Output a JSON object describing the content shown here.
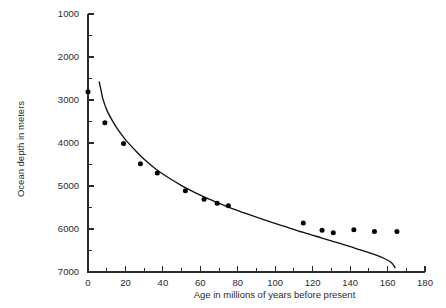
{
  "chart_data": {
    "type": "scatter",
    "title": "",
    "subtitle": "",
    "xlabel": "Age in millions of years before present",
    "ylabel": "Ocean depth in meters",
    "xlim": [
      0,
      180
    ],
    "ylim": [
      1000,
      7000
    ],
    "y_axis_inverted": true,
    "grid": false,
    "legend": null,
    "legend_position": "none",
    "x_ticks": [
      0,
      20,
      40,
      60,
      80,
      100,
      120,
      140,
      160,
      180
    ],
    "x_tick_labels": [
      "0",
      "20",
      "40",
      "60",
      "80",
      "100",
      "120",
      "140",
      "160",
      "180"
    ],
    "x_minor_ticks": [
      10,
      30,
      50,
      70,
      90,
      110,
      130,
      150,
      170
    ],
    "y_ticks": [
      1000,
      2000,
      3000,
      4000,
      5000,
      6000,
      7000
    ],
    "y_tick_labels": [
      "1000",
      "2000",
      "3000",
      "4000",
      "5000",
      "6000",
      "7000"
    ],
    "y_minor_ticks": [
      1500,
      2500,
      3500,
      4500,
      5500,
      6500
    ],
    "series": [
      {
        "name": "Observed depth",
        "type": "scatter",
        "marker": "filled-circle",
        "marker_color": "#000000",
        "points": [
          {
            "x": 0,
            "y": 2810
          },
          {
            "x": 9,
            "y": 3530
          },
          {
            "x": 19,
            "y": 4010
          },
          {
            "x": 28,
            "y": 4480
          },
          {
            "x": 37,
            "y": 4700
          },
          {
            "x": 52,
            "y": 5110
          },
          {
            "x": 62,
            "y": 5310
          },
          {
            "x": 69,
            "y": 5400
          },
          {
            "x": 75,
            "y": 5460
          },
          {
            "x": 115,
            "y": 5860
          },
          {
            "x": 125,
            "y": 6030
          },
          {
            "x": 131,
            "y": 6090
          },
          {
            "x": 142,
            "y": 6020
          },
          {
            "x": 153,
            "y": 6060
          },
          {
            "x": 165,
            "y": 6060
          }
        ]
      },
      {
        "name": "Theoretical subsidence curve",
        "type": "line",
        "line_color": "#111111",
        "points": [
          {
            "x": 6,
            "y": 2580
          },
          {
            "x": 7,
            "y": 2780
          },
          {
            "x": 8,
            "y": 2980
          },
          {
            "x": 10,
            "y": 3230
          },
          {
            "x": 13,
            "y": 3480
          },
          {
            "x": 16,
            "y": 3690
          },
          {
            "x": 20,
            "y": 3920
          },
          {
            "x": 25,
            "y": 4160
          },
          {
            "x": 30,
            "y": 4380
          },
          {
            "x": 36,
            "y": 4600
          },
          {
            "x": 42,
            "y": 4780
          },
          {
            "x": 50,
            "y": 4990
          },
          {
            "x": 58,
            "y": 5170
          },
          {
            "x": 66,
            "y": 5330
          },
          {
            "x": 75,
            "y": 5490
          },
          {
            "x": 85,
            "y": 5650
          },
          {
            "x": 95,
            "y": 5800
          },
          {
            "x": 105,
            "y": 5940
          },
          {
            "x": 115,
            "y": 6080
          },
          {
            "x": 125,
            "y": 6210
          },
          {
            "x": 135,
            "y": 6340
          },
          {
            "x": 145,
            "y": 6480
          },
          {
            "x": 152,
            "y": 6580
          },
          {
            "x": 158,
            "y": 6680
          },
          {
            "x": 162,
            "y": 6780
          },
          {
            "x": 164,
            "y": 6900
          }
        ]
      }
    ]
  }
}
